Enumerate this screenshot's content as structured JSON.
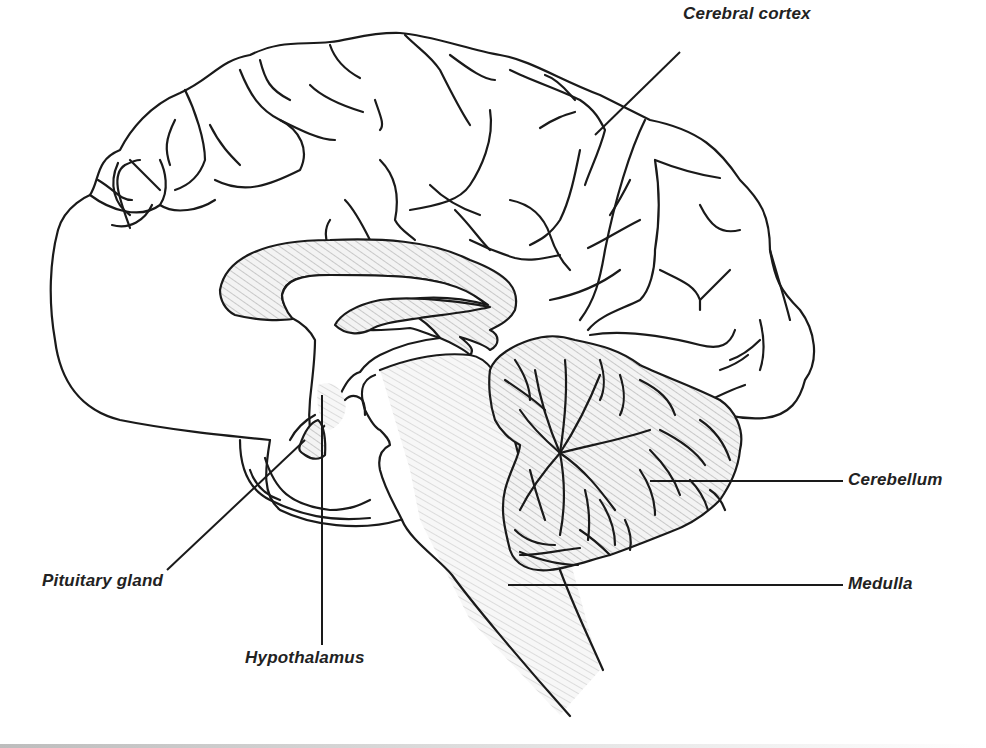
{
  "diagram": {
    "colors": {
      "stroke": "#1a1a1a",
      "hatch": "#c8c8c8",
      "background": "#ffffff",
      "label": "#222222"
    },
    "labels": [
      {
        "id": "cerebral-cortex",
        "text": "Cerebral cortex",
        "x": 683,
        "y": 4
      },
      {
        "id": "cerebellum",
        "text": "Cerebellum",
        "x": 848,
        "y": 470
      },
      {
        "id": "medulla",
        "text": "Medulla",
        "x": 848,
        "y": 574
      },
      {
        "id": "pituitary-gland",
        "text": "Pituitary gland",
        "x": 42,
        "y": 571
      },
      {
        "id": "hypothalamus",
        "text": "Hypothalamus",
        "x": 245,
        "y": 648
      }
    ]
  }
}
